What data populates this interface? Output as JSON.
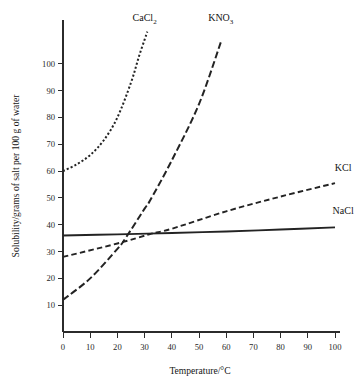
{
  "chart_data": {
    "type": "line",
    "title": "",
    "xlabel": "Temperature/°C",
    "ylabel": "Solubility/grams of salt per 100 g of water",
    "xlim": [
      0,
      100
    ],
    "ylim": [
      0,
      110
    ],
    "grid": false,
    "legend_position": "inline-curve-labels",
    "xticks": [
      0,
      10,
      20,
      30,
      40,
      50,
      60,
      70,
      80,
      90,
      100
    ],
    "xticklabels": [
      "0",
      "10",
      "20",
      "30",
      "40",
      "50",
      "60",
      "70",
      "80",
      "90",
      "100"
    ],
    "yticks": [
      10,
      20,
      30,
      40,
      50,
      60,
      70,
      80,
      90,
      100
    ],
    "yticklabels": [
      "10",
      "20",
      "30",
      "40",
      "50",
      "60",
      "70",
      "80",
      "90",
      "100"
    ],
    "series": [
      {
        "name": "CaCl2",
        "label_main": "CaCl",
        "label_sub": "2",
        "style": "dotted",
        "x": [
          0,
          5,
          10,
          15,
          20,
          25,
          28,
          30,
          31
        ],
        "values": [
          60,
          62.5,
          66,
          71.5,
          80,
          93,
          103,
          109,
          112
        ]
      },
      {
        "name": "KNO3",
        "label_main": "KNO",
        "label_sub": "3",
        "style": "dashdot",
        "x": [
          0,
          10,
          20,
          23,
          30,
          32,
          40,
          50,
          58
        ],
        "values": [
          12,
          20,
          31,
          35,
          46,
          49,
          64,
          85,
          108
        ]
      },
      {
        "name": "KCl",
        "label_main": "KCl",
        "label_sub": "",
        "style": "dashed",
        "x": [
          0,
          20,
          32,
          40,
          60,
          80,
          100
        ],
        "values": [
          28,
          33,
          36.5,
          38.5,
          45,
          50.5,
          55.5
        ]
      },
      {
        "name": "NaCl",
        "label_main": "NaCl",
        "label_sub": "",
        "style": "solid",
        "x": [
          0,
          20,
          40,
          60,
          80,
          100
        ],
        "values": [
          36,
          36.4,
          36.9,
          37.5,
          38.2,
          39
        ]
      }
    ],
    "annotations": [
      {
        "name": "CaCl2",
        "text": "CaCl₂",
        "at_x": 30,
        "at_y": 116
      },
      {
        "name": "KNO3",
        "text": "KNO₃",
        "at_x": 58,
        "at_y": 116
      },
      {
        "name": "KCl",
        "text": "KCl",
        "at_x": 103,
        "at_y": 60
      },
      {
        "name": "NaCl",
        "text": "NaCl",
        "at_x": 103,
        "at_y": 44
      }
    ]
  },
  "colors": {
    "curve": "#232323",
    "axis": "#2b2b2b",
    "background": "#ffffff"
  }
}
